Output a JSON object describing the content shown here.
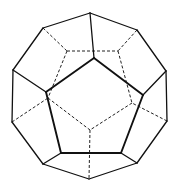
{
  "figure": {
    "style": "wireframe with hidden edges dashed",
    "colors": {
      "background": "#ffffff",
      "line": "#111111"
    }
  },
  "vertices": {
    "top": [
      90,
      13
    ],
    "ul": [
      43,
      28
    ],
    "ur": [
      137,
      30
    ],
    "l": [
      13,
      70
    ],
    "r": [
      166,
      71
    ],
    "ll": [
      12,
      122
    ],
    "lr": [
      167,
      121
    ],
    "bl": [
      43,
      164
    ],
    "br": [
      137,
      163
    ],
    "bottom": [
      89,
      179
    ],
    "f_top": [
      94,
      58
    ],
    "f_left": [
      46,
      92
    ],
    "f_right": [
      143,
      95
    ],
    "f_bl": [
      61,
      153
    ],
    "f_br": [
      121,
      153
    ],
    "h_tl": [
      67,
      51
    ],
    "h_tr": [
      118,
      51
    ],
    "h_left": [
      48,
      98
    ],
    "h_right": [
      132,
      103
    ],
    "h_center": [
      90,
      130
    ]
  },
  "edges": {
    "outer": [
      [
        "top",
        "ur"
      ],
      [
        "ur",
        "r"
      ],
      [
        "r",
        "lr"
      ],
      [
        "lr",
        "br"
      ],
      [
        "br",
        "bottom"
      ],
      [
        "bottom",
        "bl"
      ],
      [
        "bl",
        "ll"
      ],
      [
        "ll",
        "l"
      ],
      [
        "l",
        "ul"
      ],
      [
        "ul",
        "top"
      ]
    ],
    "front": [
      [
        "f_top",
        "f_right"
      ],
      [
        "f_right",
        "f_br"
      ],
      [
        "f_br",
        "f_bl"
      ],
      [
        "f_bl",
        "f_left"
      ],
      [
        "f_left",
        "f_top"
      ]
    ],
    "spokes": [
      [
        "top",
        "f_top"
      ],
      [
        "l",
        "f_left"
      ],
      [
        "r",
        "f_right"
      ],
      [
        "bl",
        "f_bl"
      ],
      [
        "br",
        "f_br"
      ]
    ],
    "hidden": [
      [
        "h_tl",
        "h_tr"
      ],
      [
        "h_tl",
        "h_left"
      ],
      [
        "h_tr",
        "h_right"
      ],
      [
        "h_left",
        "h_center"
      ],
      [
        "h_right",
        "h_center"
      ],
      [
        "ul",
        "h_tl"
      ],
      [
        "ur",
        "h_tr"
      ],
      [
        "ll",
        "h_left"
      ],
      [
        "lr",
        "h_right"
      ],
      [
        "h_center",
        "bottom"
      ]
    ]
  }
}
